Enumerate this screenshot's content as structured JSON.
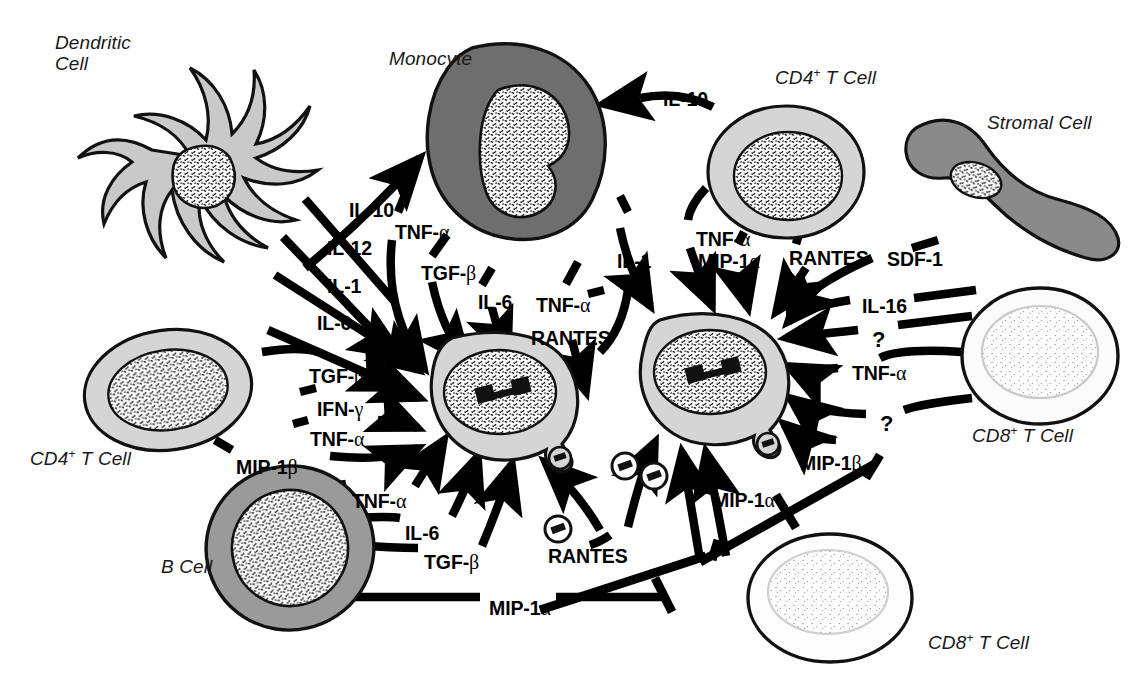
{
  "diagram": {
    "background": "#ffffff",
    "ink": "#000000"
  },
  "cells": [
    {
      "id": "dendritic-cell",
      "label": "Dendritic\nCell",
      "label_line1": "Dendritic",
      "label_line2": "Cell",
      "fill": "#c9c9c9",
      "nucleus": "stippled",
      "shape": "dendritic"
    },
    {
      "id": "monocyte",
      "label": "Monocyte",
      "fill": "#6e6e6e",
      "nucleus": "stippled",
      "shape": "blob"
    },
    {
      "id": "cd4-t-cell-top",
      "label": "CD4+ T Cell",
      "sup": "+",
      "base": "CD4",
      "tail": " T Cell",
      "fill": "#d5d5d5",
      "nucleus": "stippled",
      "shape": "oval"
    },
    {
      "id": "stromal-cell",
      "label": "Stromal Cell",
      "fill": "#8a8a8a",
      "nucleus": "stippled",
      "shape": "s-curve"
    },
    {
      "id": "cd4-t-cell-left",
      "label": "CD4+ T Cell",
      "sup": "+",
      "base": "CD4",
      "tail": " T Cell",
      "fill": "#d5d5d5",
      "nucleus": "stippled",
      "shape": "oval"
    },
    {
      "id": "b-cell",
      "label": "B Cell",
      "fill": "#9a9a9a",
      "nucleus": "stippled",
      "shape": "oval"
    },
    {
      "id": "cd8-t-cell-right",
      "label": "CD8+ T Cell",
      "sup": "+",
      "base": "CD8",
      "tail": " T Cell",
      "fill": "#fbfbfb",
      "nucleus": "pale",
      "shape": "oval"
    },
    {
      "id": "cd8-t-cell-bottom",
      "label": "CD8+ T Cell",
      "sup": "+",
      "base": "CD8",
      "tail": " T Cell",
      "fill": "#fdfdfd",
      "nucleus": "pale",
      "shape": "oval"
    },
    {
      "id": "infected-cell-left",
      "label": "",
      "fill": "#d5d5d5",
      "nucleus": "stippled-provirus",
      "shape": "infected"
    },
    {
      "id": "infected-cell-right",
      "label": "",
      "fill": "#d5d5d5",
      "nucleus": "stippled-provirus",
      "shape": "infected"
    }
  ],
  "cell_labels": {
    "dendritic_line1": "Dendritic",
    "dendritic_line2": "Cell",
    "monocyte": "Monocyte",
    "stromal": "Stromal Cell",
    "b_cell": "B Cell",
    "cd4_top_base": "CD4",
    "cd4_top_sup": "+",
    "cd4_top_tail": " T Cell",
    "cd4_left_base": "CD4",
    "cd4_left_sup": "+",
    "cd4_left_tail": " T Cell",
    "cd8_right_base": "CD8",
    "cd8_right_sup": "+",
    "cd8_right_tail": " T Cell",
    "cd8_bottom_base": "CD8",
    "cd8_bottom_sup": "+",
    "cd8_bottom_tail": " T Cell"
  },
  "mediators": [
    {
      "id": "il10-dc",
      "text": "IL-10",
      "greek": "",
      "x": 349,
      "y": 199,
      "source": "dendritic-cell",
      "target": "infected-cell-left"
    },
    {
      "id": "il12-dc",
      "text": "IL-12",
      "greek": "",
      "x": 327,
      "y": 237,
      "source": "dendritic-cell",
      "target": "infected-cell-left"
    },
    {
      "id": "il1-dc",
      "text": "IL-1",
      "greek": "",
      "x": 327,
      "y": 275,
      "source": "dendritic-cell",
      "target": "infected-cell-left"
    },
    {
      "id": "il6-dc",
      "text": "IL-6",
      "greek": "",
      "x": 317,
      "y": 312,
      "source": "dendritic-cell",
      "target": "infected-cell-left"
    },
    {
      "id": "tnfa-mono",
      "text": "TNF-",
      "greek": "α",
      "x": 395,
      "y": 221,
      "source": "monocyte",
      "target": "infected-cell-left"
    },
    {
      "id": "tgfb-mono",
      "text": "TGF-",
      "greek": "β",
      "x": 421,
      "y": 262,
      "source": "monocyte",
      "target": "infected-cell-left"
    },
    {
      "id": "il6-mono",
      "text": "IL-6",
      "greek": "",
      "x": 478,
      "y": 291,
      "source": "monocyte",
      "target": "infected-cell-left"
    },
    {
      "id": "tgfb-cd4l",
      "text": "TGF-",
      "greek": "β",
      "x": 309,
      "y": 365,
      "source": "cd4-t-cell-left",
      "target": "infected-cell-left"
    },
    {
      "id": "ifng-cd4l",
      "text": "IFN-",
      "greek": "γ",
      "x": 317,
      "y": 398,
      "source": "cd4-t-cell-left",
      "target": "infected-cell-left"
    },
    {
      "id": "tnfa-cd4l",
      "text": "TNF-",
      "greek": "α",
      "x": 310,
      "y": 428,
      "source": "cd4-t-cell-left",
      "target": "infected-cell-left"
    },
    {
      "id": "mip1b-cd4l",
      "text": "MIP-1",
      "greek": "β",
      "x": 236,
      "y": 456,
      "source": "cd4-t-cell-left",
      "target": "infected-cell-left"
    },
    {
      "id": "tnfa-bcell",
      "text": "TNF-",
      "greek": "α",
      "x": 352,
      "y": 490,
      "source": "b-cell",
      "target": "infected-cell-left"
    },
    {
      "id": "il6-bcell",
      "text": "IL-6",
      "greek": "",
      "x": 405,
      "y": 522,
      "source": "b-cell",
      "target": "infected-cell-left"
    },
    {
      "id": "tgfb-bcell",
      "text": "TGF-",
      "greek": "β",
      "x": 424,
      "y": 551,
      "source": "b-cell",
      "target": "infected-cell-left"
    },
    {
      "id": "mip1a-bcell",
      "text": "MIP-1",
      "greek": "α",
      "x": 489,
      "y": 597,
      "source": "b-cell",
      "target": "cd8-t-cell-bottom"
    },
    {
      "id": "il10-cd4t",
      "text": "IL-10",
      "greek": "",
      "x": 663,
      "y": 88,
      "source": "cd4-t-cell-top",
      "target": "monocyte"
    },
    {
      "id": "tnfa-cd4t",
      "text": "TNF-",
      "greek": "α",
      "x": 696,
      "y": 228,
      "source": "cd4-t-cell-top",
      "target": "infected-cell-right"
    },
    {
      "id": "il1-mono",
      "text": "IL-1",
      "greek": "",
      "x": 617,
      "y": 250,
      "source": "monocyte",
      "target": "infected-cell-right"
    },
    {
      "id": "mip1a-cd4t",
      "text": "MIP-1",
      "greek": "α",
      "x": 698,
      "y": 250,
      "source": "cd4-t-cell-top",
      "target": "infected-cell-right"
    },
    {
      "id": "rantes-cd4t",
      "text": "RANTES",
      "greek": "",
      "x": 789,
      "y": 247,
      "source": "cd4-t-cell-top",
      "target": "infected-cell-right"
    },
    {
      "id": "sdf1-str",
      "text": "SDF-1",
      "greek": "",
      "x": 887,
      "y": 248,
      "source": "stromal-cell",
      "target": "infected-cell-right"
    },
    {
      "id": "tnfa-ctr",
      "text": "TNF-",
      "greek": "α",
      "x": 536,
      "y": 294,
      "source": "infected-cell-right",
      "target": "infected-cell-left"
    },
    {
      "id": "rantes-ctr",
      "text": "RANTES",
      "greek": "",
      "x": 531,
      "y": 327,
      "source": "infected-cell-right",
      "target": "infected-cell-left"
    },
    {
      "id": "il16-cd8r",
      "text": "IL-16",
      "greek": "",
      "x": 862,
      "y": 295,
      "source": "cd8-t-cell-right",
      "target": "infected-cell-right"
    },
    {
      "id": "q1-cd8r",
      "text": "?",
      "greek": "",
      "x": 872,
      "y": 327,
      "source": "cd8-t-cell-right",
      "target": "infected-cell-right"
    },
    {
      "id": "tnfa-cd8r",
      "text": "TNF-",
      "greek": "α",
      "x": 852,
      "y": 362,
      "source": "cd8-t-cell-right",
      "target": "infected-cell-right"
    },
    {
      "id": "q2-cd8r",
      "text": "?",
      "greek": "",
      "x": 880,
      "y": 411,
      "source": "cd8-t-cell-right",
      "target": "infected-cell-right"
    },
    {
      "id": "mip1b-cd8r",
      "text": "MIP-1",
      "greek": "β",
      "x": 800,
      "y": 452,
      "source": "cd8-t-cell-right",
      "target": "cd8-t-cell-bottom"
    },
    {
      "id": "mip1a-ctr",
      "text": "MIP-1",
      "greek": "α",
      "x": 713,
      "y": 489,
      "source": "cd8-t-cell-bottom",
      "target": "infected-cell-right"
    },
    {
      "id": "rantes-btm",
      "text": "RANTES",
      "greek": "",
      "x": 548,
      "y": 545,
      "source": "cd8-t-cell-bottom",
      "target": "infected-cell-left"
    }
  ],
  "virion_icons": [
    {
      "id": "virion-1",
      "x": 625,
      "y": 466
    },
    {
      "id": "virion-2",
      "x": 654,
      "y": 476
    },
    {
      "id": "virion-3",
      "x": 558,
      "y": 529
    }
  ],
  "legend_notes": {
    "arrowheads": "solid filled arrowhead = stimulation / secretion",
    "tbars": "T-bar terminal = inhibition / blockade",
    "provirus": "dumbbell shape inside nucleus = integrated HIV provirus",
    "budding": "small circled dumbbell = virion"
  },
  "colors": {
    "monocyte_fill": "#6e6e6e",
    "dendritic_fill": "#c9c9c9",
    "t_cell_fill": "#d5d5d5",
    "b_cell_fill": "#9a9a9a",
    "stromal_fill": "#8a8a8a",
    "cd8_fill": "#fbfbfb",
    "outline": "#111111",
    "nucleus_bg": "#ffffff"
  }
}
